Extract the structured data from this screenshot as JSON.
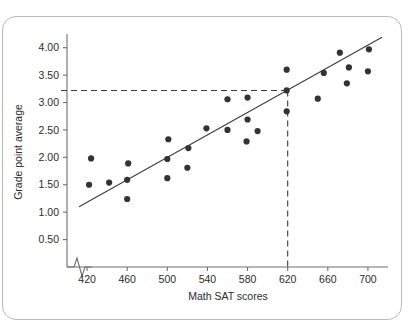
{
  "chart_data": {
    "type": "scatter",
    "title": "",
    "xlabel": "Math SAT scores",
    "ylabel": "Grade point average",
    "xlim": [
      400,
      720
    ],
    "ylim": [
      0,
      4.25
    ],
    "xticks": [
      420,
      460,
      500,
      540,
      580,
      620,
      660,
      700
    ],
    "xtick_labels": [
      "420",
      "460",
      "500",
      "540",
      "580",
      "620",
      "660",
      "700"
    ],
    "yticks": [
      0.5,
      1.0,
      1.5,
      2.0,
      2.5,
      3.0,
      3.5,
      4.0
    ],
    "ytick_labels": [
      "0.50",
      "1.00",
      "1.50",
      "2.00",
      "2.50",
      "3.00",
      "3.50",
      "4.00"
    ],
    "grid": false,
    "legend": "none",
    "axis_break": true,
    "points": [
      {
        "x": 422,
        "y": 1.5
      },
      {
        "x": 424,
        "y": 1.98
      },
      {
        "x": 442,
        "y": 1.54
      },
      {
        "x": 460,
        "y": 1.24
      },
      {
        "x": 460,
        "y": 1.59
      },
      {
        "x": 461,
        "y": 1.89
      },
      {
        "x": 500,
        "y": 1.62
      },
      {
        "x": 500,
        "y": 1.97
      },
      {
        "x": 501,
        "y": 2.33
      },
      {
        "x": 520,
        "y": 1.81
      },
      {
        "x": 521,
        "y": 2.17
      },
      {
        "x": 539,
        "y": 2.53
      },
      {
        "x": 560,
        "y": 2.5
      },
      {
        "x": 560,
        "y": 3.06
      },
      {
        "x": 579,
        "y": 2.29
      },
      {
        "x": 580,
        "y": 2.69
      },
      {
        "x": 580,
        "y": 3.09
      },
      {
        "x": 590,
        "y": 2.48
      },
      {
        "x": 619,
        "y": 2.84
      },
      {
        "x": 619,
        "y": 3.22
      },
      {
        "x": 619,
        "y": 3.6
      },
      {
        "x": 650,
        "y": 3.07
      },
      {
        "x": 656,
        "y": 3.54
      },
      {
        "x": 672,
        "y": 3.91
      },
      {
        "x": 679,
        "y": 3.35
      },
      {
        "x": 681,
        "y": 3.64
      },
      {
        "x": 700,
        "y": 3.57
      },
      {
        "x": 701,
        "y": 3.97
      }
    ],
    "regression_line": {
      "x_start": 412,
      "y_start": 1.1,
      "x_end": 714,
      "y_end": 4.19
    },
    "guides": {
      "x_value": 620,
      "y_value": 3.22,
      "style": "dashed",
      "horizontal_from_x": 404,
      "vertical_to_y": 0
    }
  },
  "colors": {
    "point": "#333333",
    "line": "#3a3a3a",
    "axis": "#6f6f6f",
    "text": "#2b2b2b",
    "card_border": "#b9b9b9",
    "background": "#ffffff"
  }
}
